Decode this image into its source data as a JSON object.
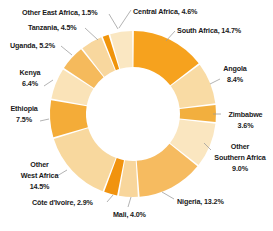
{
  "chart_data": {
    "type": "pie",
    "subtype": "donut",
    "title": "",
    "unit": "%",
    "direction": "clockwise",
    "start_angle_deg": 0,
    "background": "#FFFFFF",
    "label_text_color": "#1a1a1a",
    "leader_line_color": "#999999",
    "segments": [
      {
        "label": "South Africa",
        "value": 14.7,
        "color": "#F6A21E",
        "display": [
          "South Africa, 14.7%"
        ]
      },
      {
        "label": "Angola",
        "value": 8.4,
        "color": "#F9DBA4",
        "display": [
          "Angola",
          "8.4%"
        ]
      },
      {
        "label": "Zimbabwe",
        "value": 3.6,
        "color": "#F2AF3E",
        "display": [
          "Zimbabwe",
          "3.6%"
        ]
      },
      {
        "label": "Other Southern Africa",
        "value": 9.0,
        "color": "#FAE6C0",
        "display": [
          "Other",
          "Southern Africa",
          "9.0%"
        ]
      },
      {
        "label": "Nigeria",
        "value": 13.2,
        "color": "#F6BB60",
        "display": [
          "Nigeria, 13.2%"
        ]
      },
      {
        "label": "Mali",
        "value": 4.0,
        "color": "#F8D69C",
        "display": [
          "Mali, 4.0%"
        ]
      },
      {
        "label": "Côte d'Ivoire",
        "value": 2.9,
        "color": "#F1930E",
        "display": [
          "Côte d'Ivoire, 2.9%"
        ]
      },
      {
        "label": "Other West Africa",
        "value": 14.5,
        "color": "#F8D89E",
        "display": [
          "Other",
          "West Africa",
          "14.5%"
        ]
      },
      {
        "label": "Ethiopia",
        "value": 7.5,
        "color": "#F4AC38",
        "display": [
          "Ethiopia",
          "7.5%"
        ]
      },
      {
        "label": "Kenya",
        "value": 6.4,
        "color": "#FAE3B8",
        "display": [
          "Kenya",
          "6.4%"
        ]
      },
      {
        "label": "Uganda",
        "value": 5.2,
        "color": "#F5BA5C",
        "display": [
          "Uganda, 5.2%"
        ]
      },
      {
        "label": "Tanzania",
        "value": 4.5,
        "color": "#F8D79E",
        "display": [
          "Tanzania, 4.5%"
        ]
      },
      {
        "label": "Other East Africa",
        "value": 1.5,
        "color": "#F0940A",
        "display": [
          "Other East Africa, 1.5%"
        ]
      },
      {
        "label": "Central Africa",
        "value": 4.6,
        "color": "#FAE7C2",
        "display": [
          "Central Africa, 4.6%"
        ]
      }
    ]
  }
}
